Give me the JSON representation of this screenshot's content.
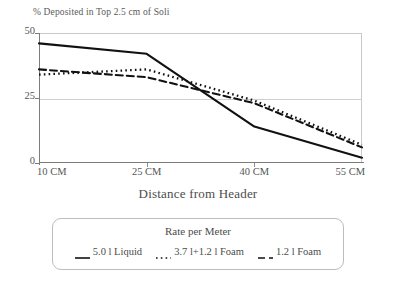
{
  "chart_data": {
    "type": "line",
    "title": "% Deposited in Top 2.5 cm of Soli",
    "xlabel": "Distance from Header",
    "ylabel": "% Deposited in Top 2.5 cm of Soli",
    "x": [
      10,
      25,
      40,
      55
    ],
    "categories": [
      "10 CM",
      "25 CM",
      "40 CM",
      "55 CM"
    ],
    "xlim": [
      10,
      55
    ],
    "ylim": [
      0,
      50
    ],
    "yticks": [
      0,
      25,
      50
    ],
    "ytick_labels": [
      "0",
      "25",
      "50"
    ],
    "xtick_labels": [
      "10 CM",
      "25 CM",
      "40 CM",
      "55 CM"
    ],
    "grid": "horizontal-at-25",
    "legend_position": "below-plot",
    "legend_title": "Rate per Meter",
    "series": [
      {
        "name": "5.0 l Liquid",
        "style": "solid",
        "color": "#111111",
        "values": [
          46,
          42,
          14,
          2
        ]
      },
      {
        "name": "3.7 l+1.2 l Foam",
        "style": "dotted",
        "color": "#111111",
        "values": [
          34,
          36,
          24,
          7
        ]
      },
      {
        "name": "1.2 l Foam",
        "style": "dashed",
        "color": "#111111",
        "values": [
          36,
          33,
          23,
          6
        ]
      }
    ]
  },
  "axes": {
    "y_title": "% Deposited in Top 2.5 cm of Soli",
    "x_title": "Distance from Header",
    "y_ticks": [
      {
        "label": "50",
        "value": 50
      },
      {
        "label": "25",
        "value": 25
      },
      {
        "label": "0",
        "value": 0
      }
    ],
    "x_ticks": [
      {
        "label": "10 CM",
        "value": 10
      },
      {
        "label": "25 CM",
        "value": 25
      },
      {
        "label": "40 CM",
        "value": 40
      },
      {
        "label": "55 CM",
        "value": 55
      }
    ]
  },
  "legend": {
    "title": "Rate per Meter",
    "entries": [
      {
        "label": "5.0 l Liquid",
        "style": "solid"
      },
      {
        "label": "3.7 l+1.2 l Foam",
        "style": "dotted"
      },
      {
        "label": "1.2 l Foam",
        "style": "dashed"
      }
    ]
  },
  "colors": {
    "line": "#111111",
    "axis": "#7d7d7d",
    "grid": "#cfcfcf",
    "text": "#4c4c4c",
    "legend_border": "#bdbdbd",
    "background": "#ffffff"
  }
}
